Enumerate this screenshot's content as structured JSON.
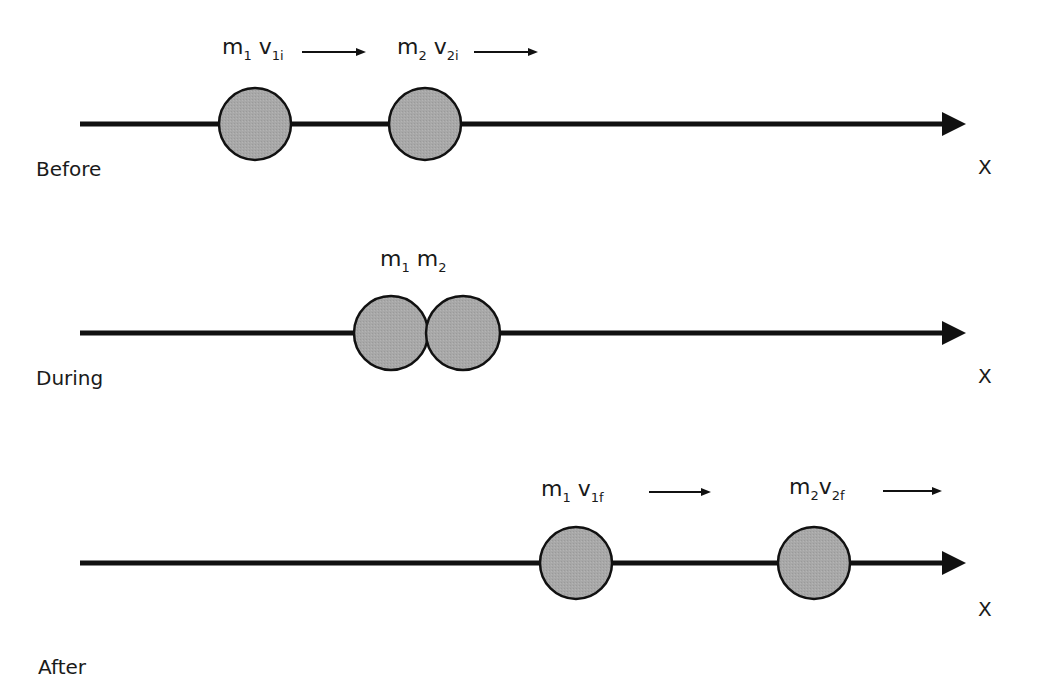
{
  "diagram": {
    "axis_label": "X",
    "stages": [
      {
        "name": "Before",
        "labels": [
          {
            "mass": "m",
            "mass_sub": "1",
            "vel": "v",
            "vel_sub": "1i"
          },
          {
            "mass": "m",
            "mass_sub": "2",
            "vel": "v",
            "vel_sub": "2i"
          }
        ]
      },
      {
        "name": "During",
        "labels": [
          {
            "mass": "m",
            "mass_sub": "1"
          },
          {
            "mass": "m",
            "mass_sub": "2"
          }
        ]
      },
      {
        "name": "After",
        "labels": [
          {
            "mass": "m",
            "mass_sub": "1",
            "vel": "v",
            "vel_sub": "1f"
          },
          {
            "mass": "m",
            "mass_sub": "2",
            "vel": "v",
            "vel_sub": "2f"
          }
        ]
      }
    ],
    "colors": {
      "ball_fill": "#a6a6a6",
      "stroke": "#111111"
    }
  }
}
